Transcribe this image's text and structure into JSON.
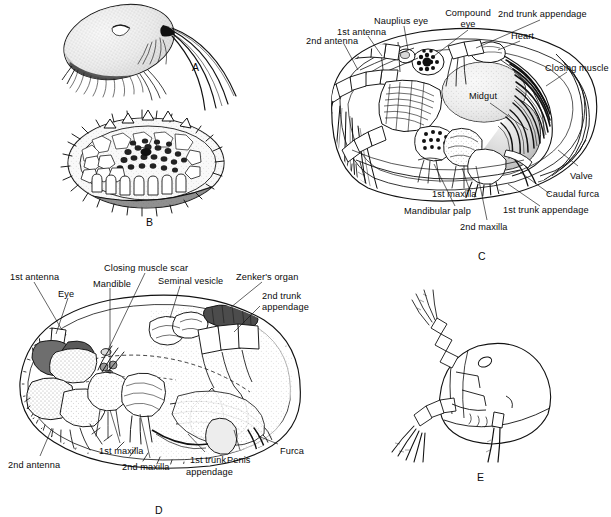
{
  "figure": {
    "panel_count": 5,
    "background_color": "#ffffff",
    "ink_color": "#0a0a0a"
  },
  "panels": [
    {
      "letter": "A",
      "name": "whole-animal-lateral-smooth-carapace",
      "letter_x": 192,
      "letter_y": 61
    },
    {
      "letter": "B",
      "name": "ornamented-carapace-valve",
      "letter_x": 146,
      "letter_y": 216
    },
    {
      "letter": "C",
      "name": "internal-anatomy-lateral-left-valve-removed",
      "letter_x": 478,
      "letter_y": 250
    },
    {
      "letter": "D",
      "name": "male-internal-anatomy-lateral",
      "letter_x": 155,
      "letter_y": 504
    },
    {
      "letter": "E",
      "name": "whole-animal-outline-lateral",
      "letter_x": 477,
      "letter_y": 471
    }
  ],
  "labels_c": [
    {
      "text": "2nd antenna",
      "x": 306,
      "y": 36,
      "align": "left"
    },
    {
      "text": "1st antenna",
      "x": 337,
      "y": 27,
      "align": "left"
    },
    {
      "text": "Nauplius eye",
      "x": 374,
      "y": 16,
      "align": "left"
    },
    {
      "text": "Compound",
      "x": 468,
      "y": 8,
      "align": "center"
    },
    {
      "text": "eye",
      "x": 468,
      "y": 19,
      "align": "center"
    },
    {
      "text": "Heart",
      "x": 511,
      "y": 31,
      "align": "left"
    },
    {
      "text": "2nd trunk appendage",
      "x": 498,
      "y": 9,
      "align": "left"
    },
    {
      "text": "Closing muscle",
      "x": 545,
      "y": 63,
      "align": "left"
    },
    {
      "text": "Midgut",
      "x": 483,
      "y": 91,
      "align": "center"
    },
    {
      "text": "Valve",
      "x": 570,
      "y": 171,
      "align": "left"
    },
    {
      "text": "Caudal furca",
      "x": 546,
      "y": 189,
      "align": "left"
    },
    {
      "text": "1st trunk appendage",
      "x": 503,
      "y": 205,
      "align": "left"
    },
    {
      "text": "1st maxilla",
      "x": 432,
      "y": 189,
      "align": "left"
    },
    {
      "text": "Mandibular palp",
      "x": 404,
      "y": 206,
      "align": "left"
    },
    {
      "text": "2nd maxilla",
      "x": 460,
      "y": 222,
      "align": "left"
    }
  ],
  "labels_d": [
    {
      "text": "1st antenna",
      "x": 10,
      "y": 272,
      "align": "left"
    },
    {
      "text": "Eye",
      "x": 58,
      "y": 289,
      "align": "left"
    },
    {
      "text": "Mandible",
      "x": 93,
      "y": 279,
      "align": "left"
    },
    {
      "text": "Closing muscle scar",
      "x": 104,
      "y": 263,
      "align": "left"
    },
    {
      "text": "Seminal vesicle",
      "x": 158,
      "y": 276,
      "align": "left"
    },
    {
      "text": "Zenker's organ",
      "x": 236,
      "y": 272,
      "align": "left"
    },
    {
      "text": "2nd trunk",
      "x": 262,
      "y": 291,
      "align": "left"
    },
    {
      "text": "appendage",
      "x": 262,
      "y": 302,
      "align": "left"
    },
    {
      "text": "Furca",
      "x": 280,
      "y": 446,
      "align": "left"
    },
    {
      "text": "Penis",
      "x": 227,
      "y": 455,
      "align": "left"
    },
    {
      "text": "1st trunk",
      "x": 190,
      "y": 455,
      "align": "left"
    },
    {
      "text": "appendage",
      "x": 186,
      "y": 467,
      "align": "left"
    },
    {
      "text": "2nd maxilla",
      "x": 122,
      "y": 462,
      "align": "left"
    },
    {
      "text": "1st maxilla",
      "x": 99,
      "y": 446,
      "align": "left"
    },
    {
      "text": "2nd antenna",
      "x": 8,
      "y": 460,
      "align": "left"
    }
  ]
}
